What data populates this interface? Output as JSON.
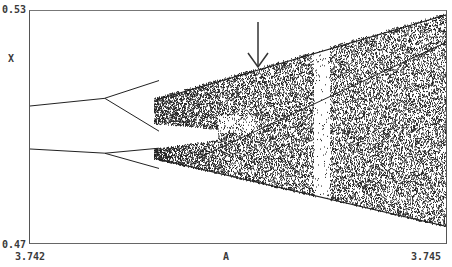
{
  "chart_data": {
    "type": "scatter",
    "title": "",
    "subtitle": "",
    "xlabel": "A",
    "ylabel": "X",
    "xlim": [
      3.742,
      3.745
    ],
    "ylim": [
      0.47,
      0.53
    ],
    "x_tick_labels": [
      "3.742",
      "3.745"
    ],
    "y_tick_labels": [
      "0.53",
      "0.47"
    ],
    "grid": false,
    "legend": null,
    "annotations": [
      {
        "type": "arrow",
        "direction": "down",
        "x_approx": 3.7435,
        "y_approx": 0.518,
        "note": "points to upper edge of chaotic band"
      }
    ],
    "series": [
      {
        "name": "upper branch",
        "x": [
          3.742,
          3.7427,
          3.7431,
          3.7433,
          3.745
        ],
        "y": [
          0.5055,
          0.5075,
          0.5105,
          0.512,
          0.5295
        ]
      },
      {
        "name": "lower branch",
        "x": [
          3.742,
          3.7431,
          3.7433,
          3.745
        ],
        "y": [
          0.4945,
          0.4915,
          0.4905,
          0.4745
        ]
      },
      {
        "name": "period-doubling points (upper)",
        "x": [
          3.7427,
          3.7431
        ],
        "y": [
          0.5075,
          0.5105
        ]
      }
    ],
    "color": "#222222"
  },
  "axes": {
    "x_min_label": "3.742",
    "x_max_label": "3.745",
    "x_title": "A",
    "y_max_label": "0.53",
    "y_min_label": "0.47",
    "y_title": "X"
  }
}
